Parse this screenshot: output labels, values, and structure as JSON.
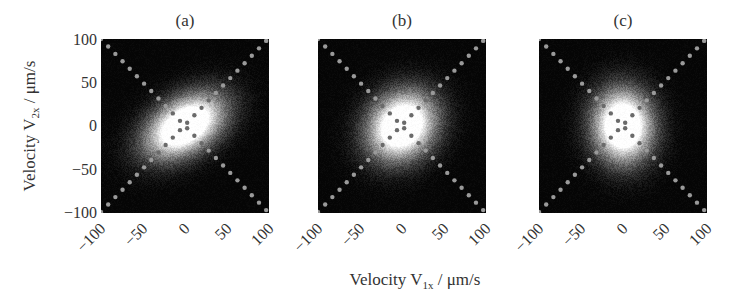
{
  "chart_data": [
    {
      "type": "heatmap",
      "title": "(a)",
      "xlabel": "Velocity V1x / μm/s",
      "ylabel": "Velocity V2x / μm/s",
      "xlim": [
        -100,
        100
      ],
      "ylim": [
        -100,
        100
      ],
      "xticks": [
        -100,
        -50,
        0,
        50,
        100
      ],
      "yticks": [
        100,
        50,
        0,
        -50,
        -100
      ],
      "description": "2D velocity joint distribution, elongated ellipse tilted along y=x (strong positive correlation)",
      "distribution": {
        "sigma_major": 45,
        "sigma_minor": 27,
        "angle_deg": 30,
        "correlation": "strong positive"
      },
      "overlay": "dotted diagonal lines y=x and y=-x"
    },
    {
      "type": "heatmap",
      "title": "(b)",
      "xlabel": "Velocity V1x / μm/s",
      "xlim": [
        -100,
        100
      ],
      "ylim": [
        -100,
        100
      ],
      "xticks": [
        -100,
        -50,
        0,
        50,
        100
      ],
      "description": "2D velocity joint distribution, slightly tilted near-circular blob (weak positive correlation)",
      "distribution": {
        "sigma_major": 38,
        "sigma_minor": 32,
        "angle_deg": 40,
        "correlation": "weak positive"
      },
      "overlay": "dotted diagonal lines y=x and y=-x"
    },
    {
      "type": "heatmap",
      "title": "(c)",
      "xlabel": "Velocity V1x / μm/s",
      "xlim": [
        -100,
        100
      ],
      "ylim": [
        -100,
        100
      ],
      "xticks": [
        -100,
        -50,
        0,
        50,
        100
      ],
      "description": "2D velocity joint distribution, near-circular, slightly vertically elongated (negligible correlation)",
      "distribution": {
        "sigma_major": 37,
        "sigma_minor": 31,
        "angle_deg": 95,
        "correlation": "none"
      },
      "overlay": "dotted diagonal lines y=x and y=-x"
    }
  ],
  "figure": {
    "panels": [
      {
        "title": "(a)",
        "left": 101
      },
      {
        "title": "(b)",
        "left": 318
      },
      {
        "title": "(c)",
        "left": 539
      }
    ],
    "yticks": [
      "100",
      "50",
      "0",
      "−50",
      "−100"
    ],
    "xticks": [
      "−100",
      "−50",
      "0",
      "50",
      "100"
    ],
    "ylabel_main": "Velocity V",
    "ylabel_sub": "2x",
    "ylabel_unit": " / μm/s",
    "xlabel_main": "Velocity V",
    "xlabel_sub": "1x",
    "xlabel_unit": " / μm/s",
    "colors": {
      "background": "#050505",
      "peak": "#ffffff",
      "dot_outer": "#9a9a9a",
      "dot_inner": "#6a6a6a"
    }
  }
}
